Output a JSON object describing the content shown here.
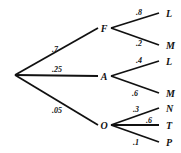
{
  "diagram": {
    "type": "probability-tree",
    "root": {
      "x": 15,
      "y": 75
    },
    "level1": [
      {
        "id": "F",
        "label": "F",
        "prob": ".7",
        "x": 104,
        "y": 28,
        "prob_pos": {
          "x": 52,
          "y": 52
        }
      },
      {
        "id": "A",
        "label": "A",
        "prob": ".25",
        "x": 104,
        "y": 76,
        "prob_pos": {
          "x": 52,
          "y": 72
        }
      },
      {
        "id": "O",
        "label": "O",
        "prob": ".05",
        "x": 104,
        "y": 125,
        "prob_pos": {
          "x": 52,
          "y": 113
        }
      }
    ],
    "level2": [
      {
        "parent": "F",
        "label": "L",
        "prob": ".8",
        "x": 166,
        "y": 13,
        "prob_pos": {
          "x": 136,
          "y": 15
        }
      },
      {
        "parent": "F",
        "label": "M",
        "prob": ".2",
        "x": 166,
        "y": 45,
        "prob_pos": {
          "x": 136,
          "y": 46
        }
      },
      {
        "parent": "A",
        "label": "L",
        "prob": ".4",
        "x": 166,
        "y": 61,
        "prob_pos": {
          "x": 136,
          "y": 63
        }
      },
      {
        "parent": "A",
        "label": "M",
        "prob": ".6",
        "x": 166,
        "y": 93,
        "prob_pos": {
          "x": 132,
          "y": 96
        }
      },
      {
        "parent": "O",
        "label": "N",
        "prob": ".3",
        "x": 166,
        "y": 108,
        "prob_pos": {
          "x": 133,
          "y": 112
        }
      },
      {
        "parent": "O",
        "label": "T",
        "prob": ".6",
        "x": 166,
        "y": 125,
        "prob_pos": {
          "x": 146,
          "y": 123
        }
      },
      {
        "parent": "O",
        "label": "P",
        "prob": ".1",
        "x": 166,
        "y": 142,
        "prob_pos": {
          "x": 133,
          "y": 145
        }
      }
    ]
  },
  "colors": {
    "line": "#111111",
    "background": "#ffffff"
  }
}
